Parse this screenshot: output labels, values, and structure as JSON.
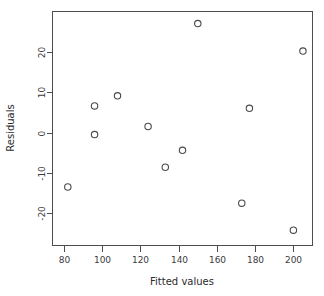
{
  "chart_data": {
    "type": "scatter",
    "title": "",
    "xlabel": "Fitted values",
    "ylabel": "Residuals",
    "xlim": [
      74,
      210
    ],
    "ylim": [
      -28,
      30
    ],
    "grid": false,
    "legend": "none",
    "marker": "open-circle",
    "marker_color": "#4a4a4a",
    "xticks": [
      80,
      100,
      120,
      140,
      160,
      180,
      200
    ],
    "xtick_labels": [
      "80",
      "100",
      "120",
      "140",
      "160",
      "180",
      "200"
    ],
    "yticks": [
      20,
      10,
      0,
      -10,
      -20
    ],
    "ytick_labels": [
      "20",
      "10",
      "0",
      "-10",
      "-20"
    ],
    "points": [
      {
        "x": 82,
        "y": -13.5
      },
      {
        "x": 96,
        "y": 6.6
      },
      {
        "x": 96,
        "y": -0.5
      },
      {
        "x": 108,
        "y": 9.1
      },
      {
        "x": 124,
        "y": 1.5
      },
      {
        "x": 133,
        "y": -8.6
      },
      {
        "x": 142,
        "y": -4.4
      },
      {
        "x": 150,
        "y": 27.0
      },
      {
        "x": 173,
        "y": -17.5
      },
      {
        "x": 177,
        "y": 6.0
      },
      {
        "x": 200,
        "y": -24.2
      },
      {
        "x": 205,
        "y": 20.2
      }
    ]
  },
  "axes": {
    "x_title": "Fitted values",
    "y_title": "Residuals"
  }
}
